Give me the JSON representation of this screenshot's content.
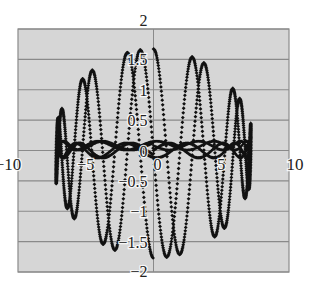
{
  "colors": {
    "page_background": "#ffffff",
    "plot_background": "#d6d6d6",
    "grid": "#8a8a8a",
    "border": "#8a8a8a",
    "marker": "#111111",
    "tick_text": "#222222"
  },
  "chart_data": {
    "type": "scatter",
    "title": "",
    "xlabel": "",
    "ylabel": "",
    "xlim": [
      -10,
      10
    ],
    "ylim": [
      -2,
      2
    ],
    "x_ticks": [
      -10,
      -5,
      0,
      5,
      10
    ],
    "y_ticks": [
      -2,
      -1.5,
      -1,
      -0.5,
      0,
      0.5,
      1,
      1.5,
      2
    ],
    "x_tick_labels": [
      "−10",
      "−5",
      "0",
      "5",
      "10"
    ],
    "y_tick_labels": [
      "−2",
      "−1.5",
      "−1",
      "−0.5",
      "0",
      "0.5",
      "1",
      "1.5",
      "2"
    ],
    "grid": {
      "horizontal": true,
      "vertical": false
    },
    "legend": null,
    "series": [
      {
        "name": "parametric curve",
        "marker": "diamond",
        "description": "Dense diamond-marker parametric curve with elliptical envelope; x spans approx -7.2..7.2, y spans approx -1.8..1.7, with a dense band near y=0",
        "x_extent": [
          -7.2,
          7.2
        ],
        "y_extent": [
          -1.8,
          1.7
        ],
        "upper_peaks": [
          {
            "x": -6.2,
            "y": 0.95
          },
          {
            "x": -5.2,
            "y": 1.15
          },
          {
            "x": -3.4,
            "y": 1.4
          },
          {
            "x": -2.2,
            "y": 1.5
          },
          {
            "x": -0.8,
            "y": 1.62
          },
          {
            "x": 1.2,
            "y": 1.6
          },
          {
            "x": 2.4,
            "y": 1.52
          },
          {
            "x": 3.6,
            "y": 1.42
          },
          {
            "x": 4.6,
            "y": 1.27
          },
          {
            "x": 5.5,
            "y": 1.12
          },
          {
            "x": 6.4,
            "y": 0.95
          },
          {
            "x": 7.0,
            "y": 0.75
          }
        ],
        "lower_troughs": [
          {
            "x": -6.6,
            "y": -0.7
          },
          {
            "x": -5.8,
            "y": -1.0
          },
          {
            "x": -4.6,
            "y": -1.28
          },
          {
            "x": -3.2,
            "y": -1.55
          },
          {
            "x": -1.6,
            "y": -1.7
          },
          {
            "x": -0.2,
            "y": -1.8
          },
          {
            "x": 1.4,
            "y": -1.72
          },
          {
            "x": 2.9,
            "y": -1.6
          },
          {
            "x": 4.1,
            "y": -1.4
          },
          {
            "x": 5.2,
            "y": -1.15
          },
          {
            "x": 6.1,
            "y": -0.9
          },
          {
            "x": 6.9,
            "y": -0.6
          }
        ],
        "center_band": {
          "x": [
            -7.2,
            7.2
          ],
          "y": [
            -0.15,
            0.15
          ]
        }
      }
    ],
    "generator": {
      "samples": 1400,
      "x_amp": 7.2,
      "y_amp": 1.72,
      "freq": 11.5,
      "band_amp": 0.12,
      "band_freq": 3.2
    }
  },
  "plot_area": {
    "left": 18,
    "top": 29,
    "right": 289,
    "bottom": 272
  }
}
